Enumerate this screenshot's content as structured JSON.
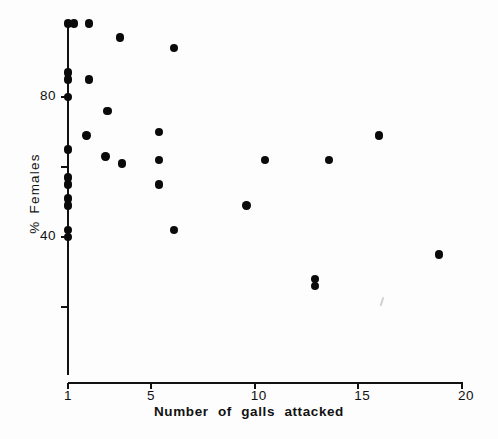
{
  "chart_data": {
    "type": "scatter",
    "title": "",
    "xlabel": "Number of galls attacked",
    "ylabel": "% Females",
    "xlim": [
      1,
      20
    ],
    "ylim": [
      13,
      103
    ],
    "grid": false,
    "legend": null,
    "x_ticks": [
      {
        "value": 1,
        "label": "1"
      },
      {
        "value": 5,
        "label": "5"
      },
      {
        "value": 10,
        "label": "10"
      },
      {
        "value": 15,
        "label": "15"
      },
      {
        "value": 20,
        "label": "20"
      }
    ],
    "y_ticks": [
      {
        "value": 80,
        "label": "80"
      },
      {
        "value": 60,
        "label": ""
      },
      {
        "value": 40,
        "label": "40"
      },
      {
        "value": 20,
        "label": ""
      }
    ],
    "marker": "filled-circle",
    "marker_color": "#0a0a0a",
    "points": [
      {
        "x": 1.0,
        "y": 101
      },
      {
        "x": 1.3,
        "y": 101
      },
      {
        "x": 2.0,
        "y": 101
      },
      {
        "x": 3.5,
        "y": 97
      },
      {
        "x": 6.1,
        "y": 94
      },
      {
        "x": 1.0,
        "y": 87
      },
      {
        "x": 1.0,
        "y": 85
      },
      {
        "x": 2.0,
        "y": 85
      },
      {
        "x": 1.0,
        "y": 80
      },
      {
        "x": 2.9,
        "y": 76
      },
      {
        "x": 5.4,
        "y": 70
      },
      {
        "x": 1.9,
        "y": 69
      },
      {
        "x": 16.0,
        "y": 69
      },
      {
        "x": 1.0,
        "y": 65
      },
      {
        "x": 2.8,
        "y": 63
      },
      {
        "x": 5.4,
        "y": 62
      },
      {
        "x": 3.6,
        "y": 61
      },
      {
        "x": 10.5,
        "y": 62
      },
      {
        "x": 13.6,
        "y": 62
      },
      {
        "x": 1.0,
        "y": 57
      },
      {
        "x": 1.0,
        "y": 55
      },
      {
        "x": 1.0,
        "y": 51
      },
      {
        "x": 1.0,
        "y": 49
      },
      {
        "x": 5.4,
        "y": 55
      },
      {
        "x": 9.6,
        "y": 49
      },
      {
        "x": 1.0,
        "y": 42
      },
      {
        "x": 1.0,
        "y": 40
      },
      {
        "x": 6.1,
        "y": 42
      },
      {
        "x": 18.9,
        "y": 35
      },
      {
        "x": 12.9,
        "y": 28
      },
      {
        "x": 12.9,
        "y": 26
      }
    ]
  }
}
